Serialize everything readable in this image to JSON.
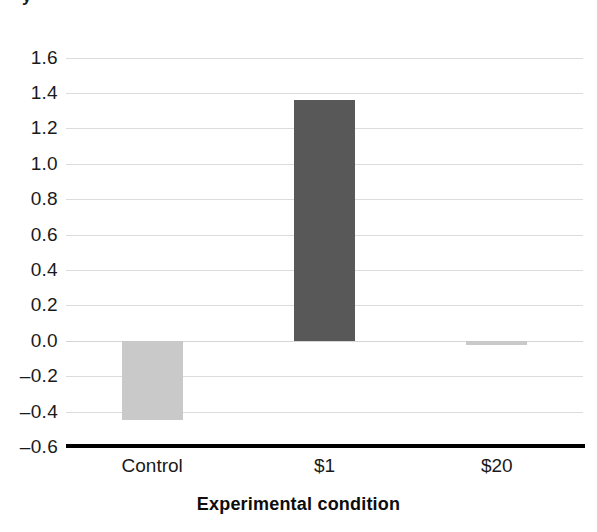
{
  "figure": {
    "cropped_top_title_fragment": "y",
    "background_color": "#ffffff"
  },
  "chart_data": {
    "type": "bar",
    "title": "",
    "categories": [
      "Control",
      "$1",
      "$20"
    ],
    "values": [
      -0.45,
      1.36,
      -0.025
    ],
    "series": [
      {
        "name": "Average amount of cheating",
        "values": [
          -0.45,
          1.36,
          -0.025
        ]
      }
    ],
    "xlabel": "Experimental condition",
    "ylabel": "",
    "ylim": [
      -0.6,
      1.7
    ],
    "yticks": [
      1.6,
      1.4,
      1.2,
      1.0,
      0.8,
      0.6,
      0.4,
      0.2,
      0.0,
      -0.2,
      -0.4,
      -0.6
    ],
    "ytick_labels": [
      "1.6",
      "1.4",
      "1.2",
      "1.0",
      "0.8",
      "0.6",
      "0.4",
      "0.2",
      "0.0",
      "–0.2",
      "–0.4",
      "–0.6"
    ],
    "grid": true,
    "grid_color": "#dcdcdc",
    "legend": null,
    "bar_colors": [
      "#c9c9c9",
      "#585858",
      "#c9c9c9"
    ],
    "bar_width_px": 61,
    "axis_line_color": "#000000"
  },
  "axes": {
    "y_ticks": [
      {
        "label": "1.6",
        "value": 1.6
      },
      {
        "label": "1.4",
        "value": 1.4
      },
      {
        "label": "1.2",
        "value": 1.2
      },
      {
        "label": "1.0",
        "value": 1.0
      },
      {
        "label": "0.8",
        "value": 0.8
      },
      {
        "label": "0.6",
        "value": 0.6
      },
      {
        "label": "0.4",
        "value": 0.4
      },
      {
        "label": "0.2",
        "value": 0.2
      },
      {
        "label": "0.0",
        "value": 0.0
      },
      {
        "label": "–0.2",
        "value": -0.2
      },
      {
        "label": "–0.4",
        "value": -0.4
      },
      {
        "label": "–0.6",
        "value": -0.6
      }
    ],
    "x_ticks": [
      {
        "label": "Control",
        "value": 0
      },
      {
        "label": "$1",
        "value": 1
      },
      {
        "label": "$20",
        "value": 2
      }
    ],
    "x_title": "Experimental condition"
  }
}
